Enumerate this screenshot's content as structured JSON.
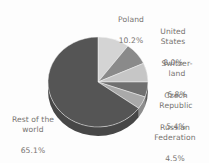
{
  "figure": {
    "background_color": "#fdfdfd",
    "text_color": "#6d6a66",
    "width": 209,
    "height": 163
  },
  "chart_data": {
    "type": "pie",
    "title": "",
    "subtitle": "",
    "xlabel": "",
    "ylabel": "",
    "grid": false,
    "legend_position": "none",
    "label_style": "outside-callout",
    "three_d": true,
    "start_angle_deg": 0,
    "direction": "clockwise",
    "categories": [
      "Poland",
      "United States",
      "Switzerland",
      "Czech Republic",
      "Russian Federation",
      "Rest of the world"
    ],
    "values": [
      10.2,
      8.0,
      6.8,
      5.4,
      4.5,
      65.1
    ],
    "value_unit": "%",
    "colors": [
      "#d4d4d4",
      "#8a8a8a",
      "#c6c6c6",
      "#6f6f6f",
      "#a9a9a9",
      "#555555"
    ],
    "slices": [
      {
        "name": "Poland",
        "value": 10.2,
        "value_label": "10.2%",
        "color": "#d4d4d4",
        "side_color": "#b6b6b6"
      },
      {
        "name": "United States",
        "value": 8.0,
        "value_label": "8.0%",
        "color": "#8a8a8a",
        "side_color": "#6f6f6f"
      },
      {
        "name": "Switzerland",
        "value": 6.8,
        "value_label": "6.8%",
        "color": "#c6c6c6",
        "side_color": "#a6a6a6"
      },
      {
        "name": "Czech Republic",
        "value": 5.4,
        "value_label": "5.4%",
        "color": "#6f6f6f",
        "side_color": "#5a5a5a"
      },
      {
        "name": "Russian Federation",
        "value": 4.5,
        "value_label": "4.5%",
        "color": "#a9a9a9",
        "side_color": "#8d8d8d"
      },
      {
        "name": "Rest of the world",
        "value": 65.1,
        "value_label": "65.1%",
        "color": "#555555",
        "side_color": "#474747"
      }
    ]
  },
  "labels": {
    "poland": {
      "name": "Poland",
      "percent": "10.2%"
    },
    "usa": {
      "name": "United\nStates",
      "percent": "8.0%"
    },
    "swiss": {
      "name": "Switzer-\nland",
      "percent": "6.8%"
    },
    "czech": {
      "name": "Czech\nRepublic",
      "percent": "5.4%"
    },
    "russia": {
      "name": "Russian\nFederation",
      "percent": "4.5%"
    },
    "rest": {
      "name": "Rest of the\nworld",
      "percent": "65.1%"
    }
  }
}
